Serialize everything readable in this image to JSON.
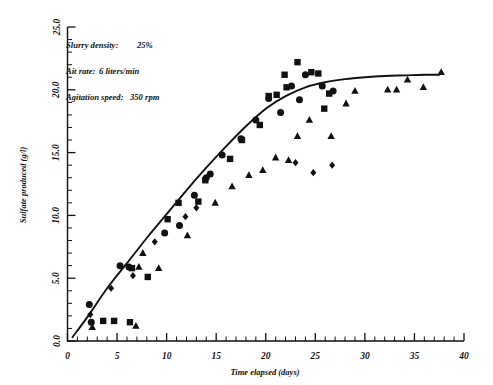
{
  "chart_data": {
    "type": "scatter",
    "title": "",
    "xlabel": "Time elapsed (days)",
    "ylabel": "Sulfate produced (g/l)",
    "xlim": [
      0,
      40
    ],
    "ylim": [
      0,
      25
    ],
    "xticks": [
      0,
      5,
      10,
      15,
      20,
      25,
      30,
      35,
      40
    ],
    "xticklabels": [
      "0",
      "5",
      "10",
      "15",
      "20",
      "25",
      "30",
      "35",
      "40"
    ],
    "yticks": [
      0.0,
      5.0,
      10.0,
      15.0,
      20.0,
      25.0
    ],
    "yticklabels": [
      "0.0",
      "5.0",
      "10.0",
      "15.0",
      "20.0",
      "25.0"
    ],
    "x_minor_interval": 1,
    "y_minor_interval": 1,
    "grid": false,
    "legend": "none",
    "annotations": [
      {
        "label": "Slurry density:",
        "value": "25%"
      },
      {
        "label": "Ait rate:",
        "value": "6 liters/min"
      },
      {
        "label": "Agitation speed:",
        "value": "350 rpm"
      }
    ],
    "fit_curve": {
      "name": "fitted sigmoid trend",
      "x": [
        0.5,
        2,
        4,
        6,
        8,
        10,
        12,
        14,
        16,
        18,
        20,
        22,
        24,
        26,
        28,
        30,
        32,
        34,
        36,
        37.5
      ],
      "y": [
        0.3,
        1.9,
        4.2,
        6.2,
        8.2,
        10.1,
        12.0,
        13.8,
        15.5,
        17.1,
        18.5,
        19.5,
        20.2,
        20.6,
        20.85,
        21.0,
        21.1,
        21.15,
        21.2,
        21.2
      ]
    },
    "series": [
      {
        "name": "circle-series",
        "marker": "circle",
        "points": [
          [
            2.2,
            2.9
          ],
          [
            2.4,
            1.5
          ],
          [
            5.3,
            6.0
          ],
          [
            6.2,
            5.9
          ],
          [
            9.8,
            8.6
          ],
          [
            11.3,
            9.2
          ],
          [
            12.8,
            11.6
          ],
          [
            14.0,
            13.0
          ],
          [
            14.4,
            13.3
          ],
          [
            15.6,
            14.8
          ],
          [
            17.5,
            16.1
          ],
          [
            19.0,
            17.6
          ],
          [
            20.3,
            19.3
          ],
          [
            21.5,
            18.2
          ],
          [
            22.6,
            20.3
          ],
          [
            23.4,
            19.2
          ],
          [
            24.0,
            21.2
          ],
          [
            25.7,
            20.3
          ],
          [
            26.8,
            19.9
          ]
        ]
      },
      {
        "name": "square-series",
        "marker": "square",
        "points": [
          [
            3.6,
            1.6
          ],
          [
            4.7,
            1.6
          ],
          [
            6.3,
            1.5
          ],
          [
            6.5,
            5.8
          ],
          [
            8.1,
            5.1
          ],
          [
            10.1,
            9.7
          ],
          [
            11.2,
            11.0
          ],
          [
            13.2,
            11.1
          ],
          [
            13.9,
            12.8
          ],
          [
            16.4,
            14.5
          ],
          [
            17.6,
            16.0
          ],
          [
            19.4,
            17.2
          ],
          [
            20.3,
            19.5
          ],
          [
            21.1,
            19.6
          ],
          [
            21.9,
            21.2
          ],
          [
            22.1,
            20.2
          ],
          [
            23.2,
            22.2
          ],
          [
            24.6,
            21.4
          ],
          [
            25.3,
            21.3
          ],
          [
            25.9,
            18.5
          ],
          [
            26.4,
            19.7
          ]
        ]
      },
      {
        "name": "triangle-series",
        "marker": "triangle",
        "points": [
          [
            2.5,
            1.1
          ],
          [
            6.9,
            1.2
          ],
          [
            7.2,
            5.9
          ],
          [
            7.6,
            7.0
          ],
          [
            9.2,
            5.8
          ],
          [
            12.1,
            8.4
          ],
          [
            14.9,
            11.0
          ],
          [
            16.6,
            12.3
          ],
          [
            18.3,
            13.2
          ],
          [
            19.7,
            13.6
          ],
          [
            21.0,
            14.6
          ],
          [
            22.3,
            14.4
          ],
          [
            23.2,
            16.3
          ],
          [
            24.4,
            17.6
          ],
          [
            26.6,
            16.3
          ],
          [
            28.1,
            18.9
          ],
          [
            29.0,
            19.9
          ],
          [
            32.3,
            20.0
          ],
          [
            33.2,
            20.0
          ],
          [
            34.3,
            20.8
          ],
          [
            35.9,
            20.2
          ],
          [
            37.7,
            21.4
          ]
        ]
      },
      {
        "name": "diamond-series",
        "marker": "diamond",
        "points": [
          [
            2.3,
            2.1
          ],
          [
            4.4,
            4.2
          ],
          [
            6.6,
            5.2
          ],
          [
            8.8,
            7.9
          ],
          [
            11.9,
            9.9
          ],
          [
            13.0,
            10.6
          ],
          [
            23.0,
            14.2
          ],
          [
            24.8,
            13.4
          ],
          [
            26.7,
            14.0
          ]
        ]
      }
    ]
  }
}
